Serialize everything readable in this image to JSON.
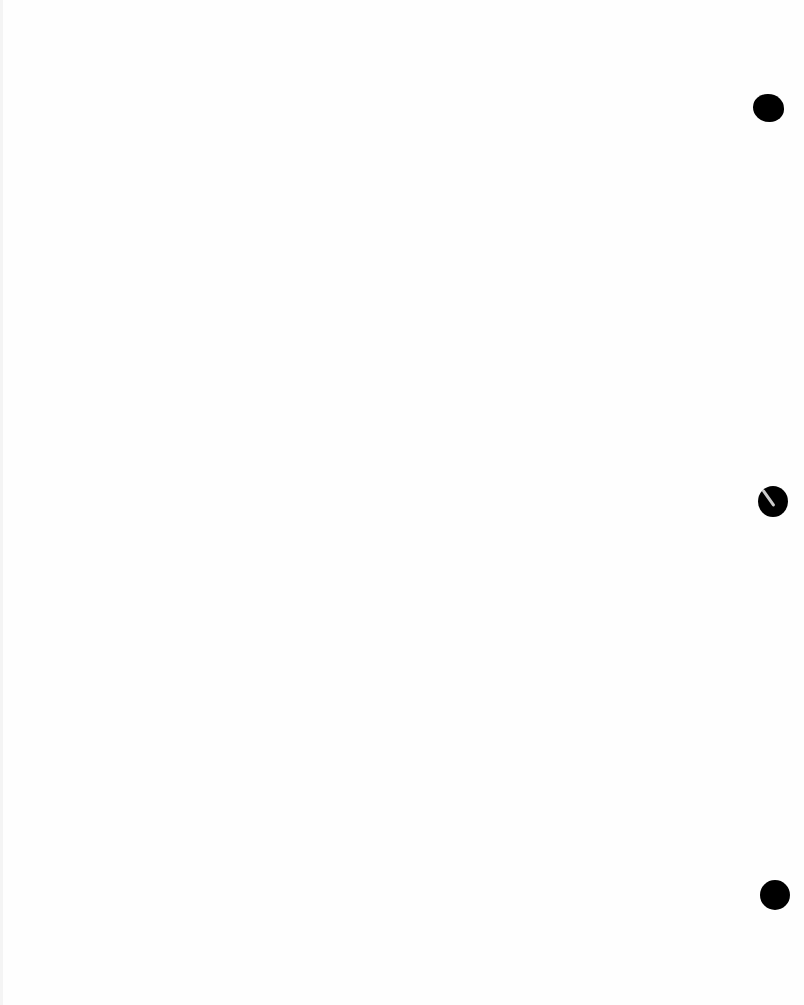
{
  "document": {
    "type": "blank scanned page",
    "text": "",
    "punch_holes": [
      {
        "id": "top",
        "cx": 768,
        "cy": 108
      },
      {
        "id": "middle",
        "cx": 773,
        "cy": 501
      },
      {
        "id": "bottom",
        "cx": 775,
        "cy": 895
      }
    ],
    "colors": {
      "paper": "#fefefe",
      "hole": "#000000"
    }
  }
}
